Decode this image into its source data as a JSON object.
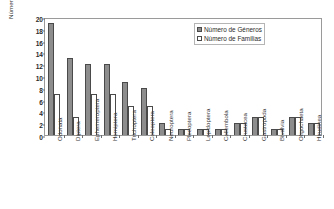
{
  "chart_data": {
    "type": "bar",
    "title": "",
    "xlabel": "",
    "ylabel": "Número de Géneros/Familias",
    "ylim": [
      0,
      20
    ],
    "ytick_step": 2,
    "yticks": [
      "0",
      "2",
      "4",
      "6",
      "8",
      "10",
      "12",
      "14",
      "16",
      "18",
      "20"
    ],
    "grid": false,
    "legend_position": "top-right",
    "categories": [
      "Odonata",
      "Diptera",
      "Ephemeroptera",
      "Hemiptera",
      "Trichoptera",
      "Coleoptera",
      "Neuroptera",
      "Plecoptera",
      "Lepidoptera",
      "Collembola",
      "Crustacea",
      "Gastropoda",
      "Bivalvia",
      "Oligochaeta",
      "Hirudinea"
    ],
    "series": [
      {
        "name": "Número de Géneros",
        "color": "#8d8d8d",
        "values": [
          19,
          13,
          12,
          12,
          9,
          8,
          2,
          1,
          1,
          1,
          2,
          3,
          1,
          3,
          2
        ]
      },
      {
        "name": "Número de Familias",
        "color": "#ffffff",
        "values": [
          7,
          3,
          7,
          7,
          5,
          5,
          1,
          1,
          1,
          1,
          2,
          3,
          1,
          3,
          2
        ]
      }
    ]
  },
  "legend": {
    "items": [
      {
        "label": "Número de Géneros",
        "style": "generos"
      },
      {
        "label": "Número de Familias",
        "style": "familias"
      }
    ]
  }
}
